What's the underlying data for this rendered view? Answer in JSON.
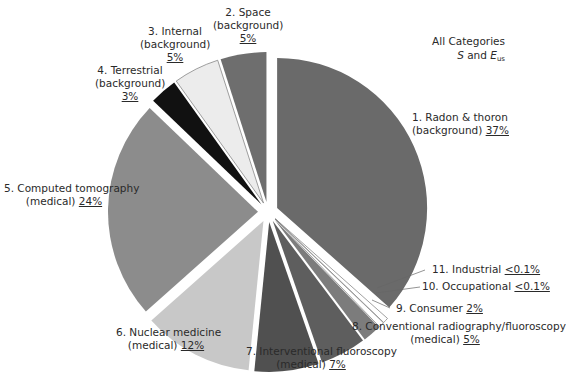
{
  "chart_data": {
    "type": "pie",
    "title": "All Categories",
    "subtitle": "S and E_us",
    "exploded": true,
    "start_angle_deg": 0,
    "direction": "clockwise",
    "slices": [
      {
        "id": 1,
        "name": "Radon & thoron",
        "group": "background",
        "value": 37,
        "label": "37%",
        "color": "#6a6a6a"
      },
      {
        "id": 11,
        "name": "Industrial",
        "group": "",
        "value": 0.1,
        "label": "<0.1%",
        "color": "#ffffff"
      },
      {
        "id": 10,
        "name": "Occupational",
        "group": "",
        "value": 0.1,
        "label": "<0.1%",
        "color": "#ffffff"
      },
      {
        "id": 9,
        "name": "Consumer",
        "group": "",
        "value": 2,
        "label": "2%",
        "color": "#7c7c7c"
      },
      {
        "id": 8,
        "name": "Conventional radiography/fluoroscopy",
        "group": "medical",
        "value": 5,
        "label": "5%",
        "color": "#5e5e5e"
      },
      {
        "id": 7,
        "name": "Interventional fluoroscopy",
        "group": "medical",
        "value": 7,
        "label": "7%",
        "color": "#505050"
      },
      {
        "id": 6,
        "name": "Nuclear medicine",
        "group": "medical",
        "value": 12,
        "label": "12%",
        "color": "#c8c8c8"
      },
      {
        "id": 5,
        "name": "Computed tomography",
        "group": "medical",
        "value": 24,
        "label": "24%",
        "color": "#8c8c8c"
      },
      {
        "id": 4,
        "name": "Terrestrial",
        "group": "background",
        "value": 3,
        "label": "3%",
        "color": "#111111"
      },
      {
        "id": 3,
        "name": "Internal",
        "group": "background",
        "value": 5,
        "label": "5%",
        "color": "#ececec"
      },
      {
        "id": 2,
        "name": "Space",
        "group": "background",
        "value": 5,
        "label": "5%",
        "color": "#6e6e6e"
      }
    ]
  },
  "title": {
    "line1": "All Categories",
    "s": "S",
    "and": " and ",
    "e": "E",
    "e_sub": "us"
  },
  "labels": {
    "radon": {
      "l1": "1. Radon & thoron",
      "l2": "(background) ",
      "pct": "37%"
    },
    "space": {
      "l1": "2. Space",
      "l2": "(background)",
      "pct": "5%"
    },
    "internal": {
      "l1": "3. Internal",
      "l2": "(background)",
      "pct": "5%"
    },
    "terrestrial": {
      "l1": "4. Terrestrial",
      "l2": "(background)",
      "pct": "3%"
    },
    "ct": {
      "l1": "5. Computed tomography",
      "l2": "(medical) ",
      "pct": "24%"
    },
    "nuclear": {
      "l1": "6. Nuclear medicine",
      "l2": "(medical) ",
      "pct": "12%"
    },
    "interventional": {
      "l1": "7. Interventional fluoroscopy",
      "l2": "(medical) ",
      "pct": "7%"
    },
    "conventional": {
      "l1": "8. Conventional radiography/fluoroscopy",
      "l2": "(medical) ",
      "pct": "5%"
    },
    "consumer": {
      "l1": "9. Consumer ",
      "pct": "2%"
    },
    "occupational": {
      "l1": "10. Occupational ",
      "pct": "<0.1%"
    },
    "industrial": {
      "l1": "11. Industrial ",
      "pct": "<0.1%"
    }
  }
}
